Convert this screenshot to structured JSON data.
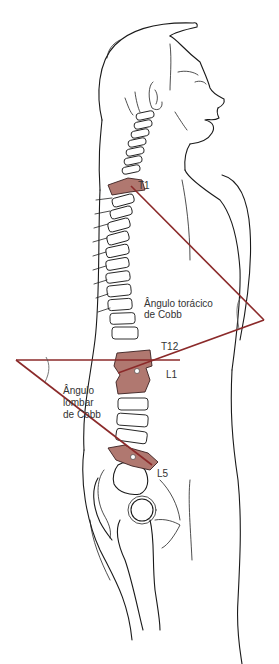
{
  "figure": {
    "colors": {
      "cobb_line": "#8b2a2a",
      "highlighted_vertebra": "#b07870",
      "outline": "#1a1a1a",
      "label_text": "#333333",
      "background": "#ffffff"
    }
  },
  "labels": {
    "t1": "T1",
    "t12": "T12",
    "l1": "L1",
    "l5": "L5",
    "thoracic_angle_line1": "Ângulo torácico",
    "thoracic_angle_line2": "de Cobb",
    "lumbar_angle_line1": "Ângulo",
    "lumbar_angle_line2": "lombar",
    "lumbar_angle_line3": "de Cobb"
  }
}
